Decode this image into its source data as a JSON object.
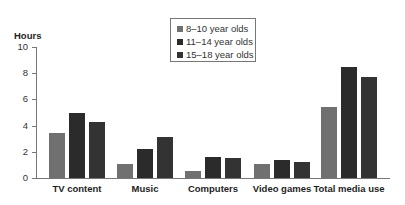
{
  "chart_data": {
    "type": "bar",
    "title": "",
    "xlabel": "",
    "ylabel": "Hours",
    "ylim": [
      0,
      10
    ],
    "yticks": [
      0,
      2,
      4,
      6,
      8,
      10
    ],
    "grid": false,
    "legend_position": "top-center",
    "categories": [
      "TV content",
      "Music",
      "Computers",
      "Video games",
      "Total media use"
    ],
    "series": [
      {
        "name": "8–10 year olds",
        "color": "#707070",
        "values": [
          3.4,
          1.1,
          0.5,
          1.1,
          5.4
        ]
      },
      {
        "name": "11–14 year olds",
        "color": "#2b2b2b",
        "values": [
          5.0,
          2.2,
          1.6,
          1.4,
          8.5
        ]
      },
      {
        "name": "15–18 year olds",
        "color": "#333333",
        "values": [
          4.3,
          3.1,
          1.5,
          1.2,
          7.7
        ]
      }
    ]
  }
}
